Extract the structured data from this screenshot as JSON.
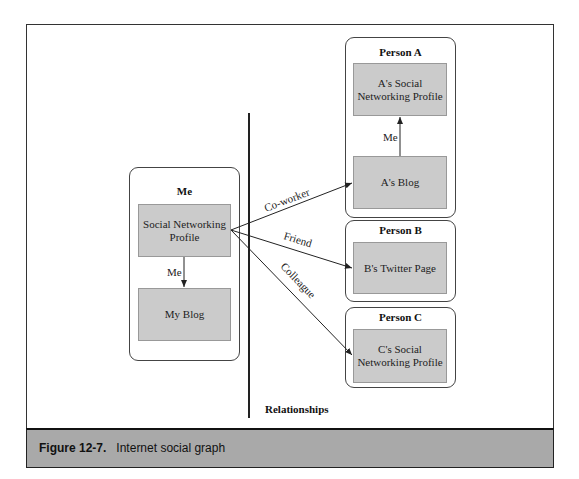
{
  "figure": {
    "caption_label": "Figure 12-7.",
    "caption_text": "Internet social graph",
    "section_label": "Relationships"
  },
  "persons": {
    "me": {
      "title": "Me",
      "nodes": [
        {
          "label": "Social Networking Profile"
        },
        {
          "label": "My Blog"
        }
      ],
      "internal_edge_label": "Me"
    },
    "a": {
      "title": "Person A",
      "nodes": [
        {
          "label": "A's Social Networking Profile"
        },
        {
          "label": "A's Blog"
        }
      ],
      "internal_edge_label": "Me"
    },
    "b": {
      "title": "Person B",
      "nodes": [
        {
          "label": "B's Twitter Page"
        }
      ]
    },
    "c": {
      "title": "Person C",
      "nodes": [
        {
          "label": "C's Social Networking Profile"
        }
      ]
    }
  },
  "edges": [
    {
      "from": "Social Networking Profile",
      "to": "My Blog",
      "label": "Me"
    },
    {
      "from": "A's Blog",
      "to": "A's Social Networking Profile",
      "label": "Me"
    },
    {
      "from": "Social Networking Profile",
      "to": "A's Blog",
      "label": "Co-worker"
    },
    {
      "from": "Social Networking Profile",
      "to": "B's Twitter Page",
      "label": "Friend"
    },
    {
      "from": "Social Networking Profile",
      "to": "C's Social Networking Profile",
      "label": "Colleague"
    }
  ],
  "colors": {
    "node_fill": "#cbcbcb",
    "caption_bar": "#a9a9a9",
    "line": "#222222"
  }
}
